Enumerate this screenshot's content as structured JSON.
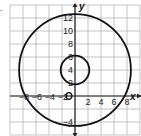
{
  "problem_marker": ".",
  "axes": {
    "x_label": "x",
    "y_label": "y",
    "origin_label": "O",
    "x_ticks": [
      {
        "value": -8,
        "label": "−8"
      },
      {
        "value": -6,
        "label": "−6"
      },
      {
        "value": -4,
        "label": "−4"
      },
      {
        "value": -2,
        "label": "−2"
      },
      {
        "value": 2,
        "label": "2"
      },
      {
        "value": 4,
        "label": "4"
      },
      {
        "value": 6,
        "label": "6"
      },
      {
        "value": 8,
        "label": "8"
      }
    ],
    "y_ticks": [
      {
        "value": -4,
        "label": "−4"
      },
      {
        "value": 2,
        "label": "2"
      },
      {
        "value": 4,
        "label": "4"
      },
      {
        "value": 6,
        "label": "6"
      },
      {
        "value": 8,
        "label": "8"
      },
      {
        "value": 10,
        "label": "10"
      },
      {
        "value": 12,
        "label": "12"
      }
    ],
    "grid_step": 2,
    "x_range": [
      -10,
      10
    ],
    "y_range": [
      -6,
      14
    ]
  },
  "circles": [
    {
      "name": "large-circle",
      "center": [
        0,
        4
      ],
      "radius": 8.6,
      "color": "#111111"
    },
    {
      "name": "small-circle",
      "center": [
        0,
        4
      ],
      "radius": 2.2,
      "color": "#111111"
    }
  ],
  "colors": {
    "grid": "#b5b5b5",
    "axis": "#222222",
    "curve": "#111111"
  }
}
